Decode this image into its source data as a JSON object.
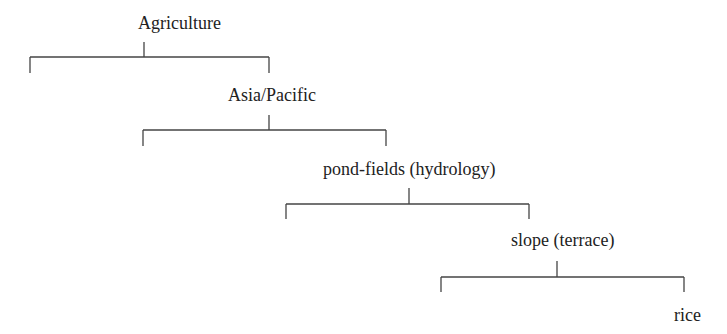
{
  "diagram": {
    "type": "hierarchy-bracket-tree",
    "nodes": [
      {
        "label": "Agriculture",
        "level": 0
      },
      {
        "label": "Asia/Pacific",
        "level": 1
      },
      {
        "label": "pond-fields (hydrology)",
        "level": 2
      },
      {
        "label": "slope (terrace)",
        "level": 3
      },
      {
        "label": "rice",
        "level": 4
      }
    ],
    "line_color": "#444444",
    "text_color": "#222222"
  }
}
